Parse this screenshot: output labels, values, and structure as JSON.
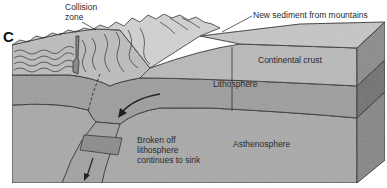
{
  "figure": {
    "panel_letter": "C",
    "type": "block-diagram"
  },
  "labels": {
    "collision_zone_line1": "Collision",
    "collision_zone_line2": "zone",
    "new_sediment": "New sediment from mountains",
    "continental_crust": "Continental crust",
    "lithosphere": "Lithosphere",
    "asthenosphere": "Asthenosphere",
    "broken_line1": "Broken off",
    "broken_line2": "lithosphere",
    "broken_line3": "continues to sink"
  },
  "colors": {
    "background": "#ffffff",
    "crust": "#b9b9b9",
    "lithosphere": "#9d9d9d",
    "asthenosphere": "#a9a9a9",
    "top_surface": "#c6c6c6",
    "right_face_crust": "#8a8a8a",
    "right_face_litho": "#6e6e6e",
    "right_face_astheno": "#858585",
    "outline": "#222222",
    "mountains": "#d2d2d2"
  }
}
